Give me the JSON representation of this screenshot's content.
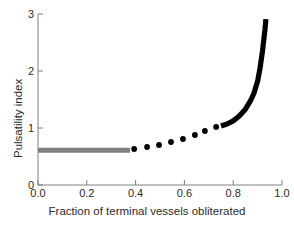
{
  "chart_data": {
    "type": "line",
    "title": "",
    "xlabel": "Fraction of terminal vessels obliterated",
    "ylabel": "Pulsatility index",
    "xlim": [
      0.0,
      1.0
    ],
    "ylim": [
      0.0,
      3.0
    ],
    "xticks": [
      "0.0",
      "0.2",
      "0.4",
      "0.6",
      "0.8",
      "1.0"
    ],
    "xtick_values": [
      0.0,
      0.2,
      0.4,
      0.6,
      0.8,
      1.0
    ],
    "yticks": [
      "0",
      "1",
      "2",
      "3"
    ],
    "ytick_values": [
      0,
      1,
      2,
      3
    ],
    "grid": false,
    "legend": "none",
    "series": [
      {
        "name": "baseline-plateau",
        "style": "thick-line",
        "color": "#808080",
        "x": [
          0.0,
          0.377
        ],
        "values": [
          0.61,
          0.61
        ]
      },
      {
        "name": "transition-points",
        "style": "markers",
        "color": "#000000",
        "x": [
          0.394,
          0.447,
          0.496,
          0.545,
          0.594,
          0.643,
          0.684,
          0.73
        ],
        "values": [
          0.632,
          0.667,
          0.702,
          0.754,
          0.807,
          0.877,
          0.947,
          1.018
        ]
      },
      {
        "name": "steep-rise",
        "style": "thick-line",
        "color": "#000000",
        "x": [
          0.75,
          0.775,
          0.8,
          0.825,
          0.85,
          0.87,
          0.885,
          0.9,
          0.91,
          0.92,
          0.93,
          0.934
        ],
        "values": [
          1.035,
          1.07,
          1.125,
          1.21,
          1.33,
          1.47,
          1.61,
          1.82,
          2.05,
          2.35,
          2.72,
          2.91
        ]
      }
    ]
  },
  "axes": {
    "x_axis_name": "x-axis",
    "y_axis_name": "y-axis"
  }
}
